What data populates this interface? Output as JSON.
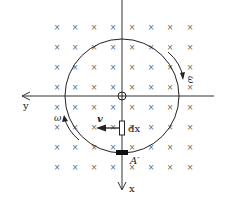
{
  "diagram": {
    "field_symbol": "×",
    "field_grid": {
      "columns_x": [
        57,
        75,
        94,
        113,
        132,
        151,
        170,
        190
      ],
      "rows_y": [
        27,
        47,
        67,
        87,
        107,
        127,
        147,
        167
      ]
    },
    "axes": {
      "x_label": "x",
      "y_label": "y",
      "origin": [
        122,
        96
      ]
    },
    "circle": {
      "cx": 122,
      "cy": 96,
      "r": 57
    },
    "labels": {
      "omega_right": "ω",
      "omega_left": "ω",
      "velocity": "v",
      "element": "dx",
      "point": "A′"
    },
    "colors": {
      "line": "#222222",
      "cross": "#666666",
      "background": "#ffffff"
    }
  }
}
